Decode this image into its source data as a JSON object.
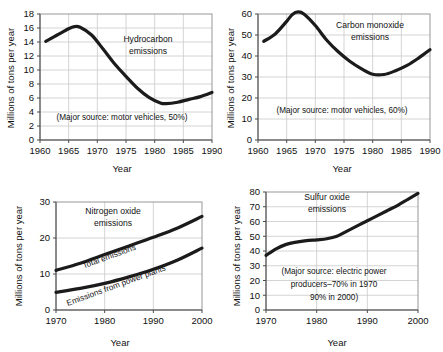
{
  "figure": {
    "panels": [
      "hydrocarbon",
      "carbon-monoxide",
      "nitrogen-oxide",
      "sulfur-oxide"
    ],
    "ink_color": "#1b1b1b",
    "grid_color": "#c9c9c9",
    "background": "#ffffff"
  },
  "chart_data": [
    {
      "id": "hydrocarbon",
      "type": "line",
      "title": "Hydrocarbon emissions",
      "title_lines": [
        "Hydrocarbon",
        "emissions"
      ],
      "annotation": "(Major source: motor vehicles, 50%)",
      "xlabel": "Year",
      "ylabel": "Millions of tons per year",
      "xlim": [
        1960,
        1990
      ],
      "ylim": [
        0,
        18
      ],
      "xticks": [
        1960,
        1965,
        1970,
        1975,
        1980,
        1985,
        1990
      ],
      "yticks": [
        0,
        2,
        4,
        6,
        8,
        10,
        12,
        14,
        16,
        18
      ],
      "grid": true,
      "legend": "none",
      "x": [
        1961,
        1963,
        1965,
        1966,
        1967,
        1969,
        1971,
        1973,
        1975,
        1977,
        1979,
        1981,
        1982,
        1984,
        1986,
        1988,
        1990
      ],
      "values": [
        14.1,
        15.0,
        15.9,
        16.2,
        16.1,
        15.0,
        13.0,
        10.9,
        9.1,
        7.4,
        6.1,
        5.3,
        5.2,
        5.4,
        5.8,
        6.2,
        6.8
      ]
    },
    {
      "id": "carbon-monoxide",
      "type": "line",
      "title": "Carbon monoxide emissions",
      "title_lines": [
        "Carbon monoxide",
        "emissions"
      ],
      "annotation": "(Major source: motor vehicles, 60%)",
      "xlabel": "Year",
      "ylabel": "Millions of tons per year",
      "xlim": [
        1960,
        1990
      ],
      "ylim": [
        0,
        60
      ],
      "xticks": [
        1960,
        1965,
        1970,
        1975,
        1980,
        1985,
        1990
      ],
      "yticks": [
        0,
        10,
        20,
        30,
        40,
        50,
        60
      ],
      "grid": true,
      "legend": "none",
      "x": [
        1961,
        1963,
        1965,
        1966,
        1967,
        1968,
        1970,
        1972,
        1974,
        1976,
        1978,
        1980,
        1982,
        1984,
        1986,
        1988,
        1990
      ],
      "values": [
        47.0,
        50.5,
        56.5,
        59.8,
        61.0,
        60.0,
        54.5,
        47.5,
        42.0,
        37.5,
        34.0,
        31.3,
        31.2,
        33.0,
        35.5,
        39.0,
        43.0
      ]
    },
    {
      "id": "nitrogen-oxide",
      "type": "line",
      "title": "Nitrogen oxide emissions",
      "title_lines": [
        "Nitrogen oxide",
        "emissions"
      ],
      "annotation": "",
      "xlabel": "Year",
      "ylabel": "Millions of tons per year",
      "xlim": [
        1970,
        2000
      ],
      "ylim": [
        0,
        30
      ],
      "xticks": [
        1970,
        1980,
        1990,
        2000
      ],
      "yticks": [
        0,
        10,
        20,
        30
      ],
      "grid": true,
      "legend": "inline-curve-labels",
      "x": [
        1970,
        1975,
        1980,
        1985,
        1990,
        1995,
        2000
      ],
      "series": [
        {
          "name": "Total emissions",
          "values": [
            11.0,
            13.0,
            15.4,
            17.8,
            20.2,
            22.8,
            26.0
          ]
        },
        {
          "name": "Emissions from power plants",
          "values": [
            4.9,
            6.0,
            7.4,
            9.2,
            11.3,
            13.9,
            17.2
          ]
        }
      ]
    },
    {
      "id": "sulfur-oxide",
      "type": "line",
      "title": "Sulfur oxide emissions",
      "title_lines": [
        "Sulfur oxide",
        "emissions"
      ],
      "annotation_lines": [
        "(Major source: electric power",
        "producers–70% in 1970",
        "90% in 2000)"
      ],
      "xlabel": "Year",
      "ylabel": "Millions of tons per year",
      "xlim": [
        1970,
        2000
      ],
      "ylim": [
        0,
        80
      ],
      "xticks": [
        1970,
        1980,
        1990,
        2000
      ],
      "yticks": [
        0,
        10,
        20,
        30,
        40,
        50,
        60,
        70,
        80
      ],
      "grid": true,
      "legend": "none",
      "x": [
        1970,
        1972,
        1974,
        1976,
        1978,
        1980,
        1982,
        1984,
        1986,
        1988,
        1990,
        1992,
        1994,
        1996,
        1998,
        2000
      ],
      "values": [
        37.0,
        41.5,
        44.5,
        46.0,
        47.0,
        47.6,
        48.3,
        50.0,
        53.5,
        57.0,
        60.5,
        64.0,
        67.5,
        71.0,
        75.0,
        79.0
      ]
    }
  ]
}
